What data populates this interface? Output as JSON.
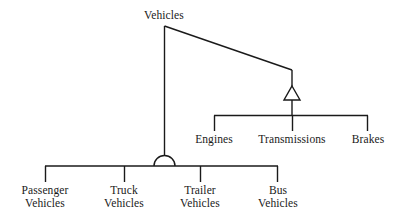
{
  "diagram": {
    "type": "uml-class-hierarchy",
    "title_node": "Vehicles",
    "background_color": "#ffffff",
    "stroke_color": "#1a1a1a",
    "text_color": "#1a1a1a",
    "root": {
      "label": "Vehicles",
      "x": 164,
      "y": 16
    },
    "aggregation_branch": {
      "marker": "hollow-triangle",
      "marker_center_x": 292,
      "children": [
        {
          "label": "Engines",
          "x": 214
        },
        {
          "label": "Transmissions",
          "x": 292
        },
        {
          "label": "Brakes",
          "x": 368
        }
      ]
    },
    "specialization_branch": {
      "marker": "semicircle-arc",
      "marker_center_x": 164,
      "children": [
        {
          "label_line1": "Passenger",
          "label_line2": "Vehicles",
          "x": 45
        },
        {
          "label_line1": "Truck",
          "label_line2": "Vehicles",
          "x": 124
        },
        {
          "label_line1": "Trailer",
          "label_line2": "Vehicles",
          "x": 200
        },
        {
          "label_line1": "Bus",
          "label_line2": "Vehicles",
          "x": 278
        }
      ]
    }
  }
}
